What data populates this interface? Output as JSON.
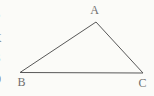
{
  "figure": {
    "background": "#fbfbf8",
    "line_color": "#585858",
    "label_color": "#6f6f6f",
    "fragment_color": "#7a7a7a",
    "vertices": [
      {
        "label": "A",
        "x": 96,
        "y": 22,
        "label_x": 94.5,
        "label_y": 9.5
      },
      {
        "label": "B",
        "x": 20,
        "y": 72.5,
        "label_x": 21.5,
        "label_y": 82
      },
      {
        "label": "C",
        "x": 143,
        "y": 73,
        "label_x": 142.5,
        "label_y": 82.5
      }
    ],
    "clipped_left_text_fragments": [
      {
        "char": "E",
        "center_y": 13,
        "left": -7
      },
      {
        "char": "X",
        "center_y": 38,
        "left": -7
      },
      {
        "char": "S",
        "center_y": 58,
        "left": -6
      },
      {
        "char": "0",
        "center_y": 79,
        "left": -5
      }
    ]
  }
}
